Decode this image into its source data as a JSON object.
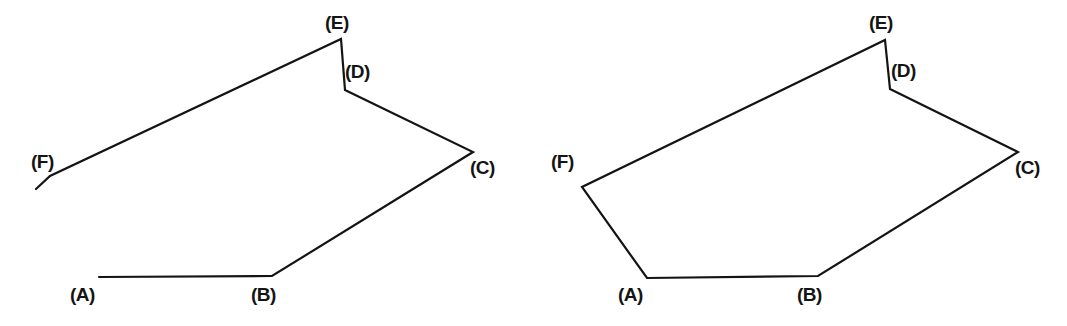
{
  "image": {
    "title": "Two line-figure diagrams: open polyline (left) and closed polygon (right)",
    "width": 1067,
    "height": 326,
    "background_color": "#ffffff",
    "stroke_color": "#141414",
    "stroke_width": 2.2
  },
  "figures": [
    {
      "id": "left-figure",
      "name": "open-polyline-figure",
      "closed": false,
      "description": "Open polyline A-B-C-D-E-F with a free tail extending past F; segment F-A is absent",
      "path": "M 99 277 L 272 276 L 473 152 L 345 90 L 341 39 L 50 176 L 36 189",
      "vertices": [
        {
          "key": "A",
          "label": "(A)",
          "x": 99,
          "y": 277,
          "label_x": 70,
          "label_y": 285
        },
        {
          "key": "B",
          "label": "(B)",
          "x": 272,
          "y": 276,
          "label_x": 251,
          "label_y": 285
        },
        {
          "key": "C",
          "label": "(C)",
          "x": 473,
          "y": 152,
          "label_x": 470,
          "label_y": 158
        },
        {
          "key": "D",
          "label": "(D)",
          "x": 345,
          "y": 90,
          "label_x": 345,
          "label_y": 62
        },
        {
          "key": "E",
          "label": "(E)",
          "x": 341,
          "y": 39,
          "label_x": 325,
          "label_y": 13
        },
        {
          "key": "F",
          "label": "(F)",
          "x": 50,
          "y": 176,
          "label_x": 31,
          "label_y": 152
        }
      ],
      "open_end": {
        "x": 36,
        "y": 189
      }
    },
    {
      "id": "right-figure",
      "name": "closed-polygon-figure",
      "closed": true,
      "description": "Closed hexagonal polygon A-B-C-D-E-F-A",
      "path": "M 647 278 L 818 276 L 1018 152 L 890 89 L 885 40 L 582 187 Z",
      "vertices": [
        {
          "key": "A",
          "label": "(A)",
          "x": 647,
          "y": 278,
          "label_x": 618,
          "label_y": 285
        },
        {
          "key": "B",
          "label": "(B)",
          "x": 818,
          "y": 276,
          "label_x": 797,
          "label_y": 285
        },
        {
          "key": "C",
          "label": "(C)",
          "x": 1018,
          "y": 152,
          "label_x": 1015,
          "label_y": 158
        },
        {
          "key": "D",
          "label": "(D)",
          "x": 890,
          "y": 89,
          "label_x": 891,
          "label_y": 61
        },
        {
          "key": "E",
          "label": "(E)",
          "x": 885,
          "y": 40,
          "label_x": 869,
          "label_y": 13
        },
        {
          "key": "F",
          "label": "(F)",
          "x": 582,
          "y": 187,
          "label_x": 551,
          "label_y": 152
        }
      ],
      "open_end": null
    }
  ]
}
